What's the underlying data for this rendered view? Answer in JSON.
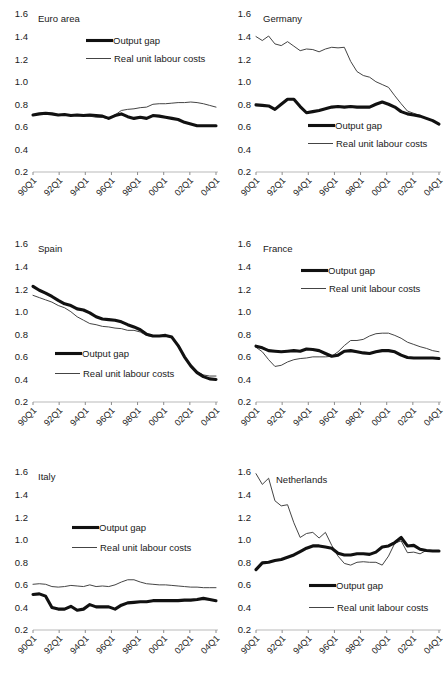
{
  "figure": {
    "panel_titles": [
      "Euro area",
      "Germany",
      "Spain",
      "France",
      "Italy",
      "Netherlands"
    ],
    "legend": {
      "output_gap": "Output gap",
      "rulc": "Real unit labour costs"
    },
    "axis": {
      "y_ticks": [
        "0.2",
        "0.4",
        "0.6",
        "0.8",
        "1.0",
        "1.2",
        "1.4",
        "1.6"
      ],
      "x_ticks": [
        "90Q1",
        "92Q1",
        "94Q1",
        "96Q1",
        "98Q1",
        "00Q1",
        "02Q1",
        "04Q1"
      ],
      "ylim": [
        0.2,
        1.6
      ],
      "grid": false
    },
    "colors": {
      "output_gap": "#111111",
      "rulc": "#444444",
      "axis": "#b9b9b9",
      "background": "#ffffff"
    }
  },
  "chart_data": [
    {
      "type": "line",
      "title": "Euro area",
      "xlabel": "",
      "ylabel": "",
      "ylim": [
        0.2,
        1.6
      ],
      "x": [
        "90Q1",
        "90Q3",
        "91Q1",
        "91Q3",
        "92Q1",
        "92Q3",
        "93Q1",
        "93Q3",
        "94Q1",
        "94Q3",
        "95Q1",
        "95Q3",
        "96Q1",
        "96Q3",
        "97Q1",
        "97Q3",
        "98Q1",
        "98Q3",
        "99Q1",
        "99Q3",
        "00Q1",
        "00Q3",
        "01Q1",
        "01Q3",
        "02Q1",
        "02Q3",
        "03Q1",
        "03Q3",
        "04Q1",
        "04Q3"
      ],
      "series": [
        {
          "name": "Output gap",
          "values": [
            0.705,
            0.715,
            0.72,
            0.715,
            0.705,
            0.71,
            0.7,
            0.705,
            0.7,
            0.705,
            0.7,
            0.695,
            0.675,
            0.7,
            0.715,
            0.69,
            0.675,
            0.685,
            0.675,
            0.7,
            0.695,
            0.685,
            0.675,
            0.665,
            0.64,
            0.625,
            0.61,
            0.61,
            0.61,
            0.61
          ]
        },
        {
          "name": "Real unit labour costs",
          "values": [
            0.705,
            0.715,
            0.715,
            0.71,
            0.705,
            0.71,
            0.7,
            0.7,
            0.695,
            0.695,
            0.685,
            0.685,
            0.67,
            0.705,
            0.745,
            0.755,
            0.76,
            0.77,
            0.775,
            0.8,
            0.805,
            0.805,
            0.81,
            0.815,
            0.815,
            0.82,
            0.815,
            0.805,
            0.79,
            0.775
          ]
        }
      ]
    },
    {
      "type": "line",
      "title": "Germany",
      "xlabel": "",
      "ylabel": "",
      "ylim": [
        0.2,
        1.6
      ],
      "x": [
        "90Q1",
        "90Q3",
        "91Q1",
        "91Q3",
        "92Q1",
        "92Q3",
        "93Q1",
        "93Q3",
        "94Q1",
        "94Q3",
        "95Q1",
        "95Q3",
        "96Q1",
        "96Q3",
        "97Q1",
        "97Q3",
        "98Q1",
        "98Q3",
        "99Q1",
        "99Q3",
        "00Q1",
        "00Q3",
        "01Q1",
        "01Q3",
        "02Q1",
        "02Q3",
        "03Q1",
        "03Q3",
        "04Q1",
        "04Q3"
      ],
      "series": [
        {
          "name": "Output gap",
          "values": [
            0.795,
            0.79,
            0.785,
            0.755,
            0.8,
            0.845,
            0.845,
            0.78,
            0.725,
            0.735,
            0.745,
            0.76,
            0.775,
            0.78,
            0.775,
            0.78,
            0.775,
            0.775,
            0.775,
            0.8,
            0.82,
            0.8,
            0.775,
            0.735,
            0.715,
            0.705,
            0.695,
            0.675,
            0.655,
            0.625
          ]
        },
        {
          "name": "Real unit labour costs",
          "values": [
            1.4,
            1.365,
            1.405,
            1.335,
            1.32,
            1.355,
            1.315,
            1.275,
            1.29,
            1.285,
            1.265,
            1.29,
            1.305,
            1.3,
            1.305,
            1.18,
            1.09,
            1.055,
            1.04,
            1.0,
            0.975,
            0.95,
            0.875,
            0.805,
            0.74,
            0.72,
            0.7,
            0.675,
            0.655,
            0.625
          ]
        }
      ]
    },
    {
      "type": "line",
      "title": "Spain",
      "xlabel": "",
      "ylabel": "",
      "ylim": [
        0.2,
        1.6
      ],
      "x": [
        "90Q1",
        "90Q3",
        "91Q1",
        "91Q3",
        "92Q1",
        "92Q3",
        "93Q1",
        "93Q3",
        "94Q1",
        "94Q3",
        "95Q1",
        "95Q3",
        "96Q1",
        "96Q3",
        "97Q1",
        "97Q3",
        "98Q1",
        "98Q3",
        "99Q1",
        "99Q3",
        "00Q1",
        "00Q3",
        "01Q1",
        "01Q3",
        "02Q1",
        "02Q3",
        "03Q1",
        "03Q3",
        "04Q1",
        "04Q3"
      ],
      "series": [
        {
          "name": "Output gap",
          "values": [
            1.225,
            1.19,
            1.165,
            1.135,
            1.1,
            1.07,
            1.055,
            1.025,
            1.015,
            0.99,
            0.955,
            0.935,
            0.93,
            0.925,
            0.91,
            0.885,
            0.865,
            0.84,
            0.8,
            0.785,
            0.785,
            0.79,
            0.775,
            0.7,
            0.6,
            0.52,
            0.46,
            0.425,
            0.405,
            0.4
          ]
        },
        {
          "name": "Real unit labour costs",
          "values": [
            1.145,
            1.125,
            1.105,
            1.085,
            1.055,
            1.035,
            1.0,
            0.955,
            0.925,
            0.895,
            0.885,
            0.87,
            0.865,
            0.855,
            0.85,
            0.835,
            0.835,
            0.82,
            0.79,
            0.78,
            0.785,
            0.79,
            0.775,
            0.705,
            0.605,
            0.525,
            0.47,
            0.44,
            0.43,
            0.43
          ]
        }
      ]
    },
    {
      "type": "line",
      "title": "France",
      "xlabel": "",
      "ylabel": "",
      "ylim": [
        0.2,
        1.6
      ],
      "x": [
        "90Q1",
        "90Q3",
        "91Q1",
        "91Q3",
        "92Q1",
        "92Q3",
        "93Q1",
        "93Q3",
        "94Q1",
        "94Q3",
        "95Q1",
        "95Q3",
        "96Q1",
        "96Q3",
        "97Q1",
        "97Q3",
        "98Q1",
        "98Q3",
        "99Q1",
        "99Q3",
        "00Q1",
        "00Q3",
        "01Q1",
        "01Q3",
        "02Q1",
        "02Q3",
        "03Q1",
        "03Q3",
        "04Q1",
        "04Q3"
      ],
      "series": [
        {
          "name": "Output gap",
          "values": [
            0.695,
            0.68,
            0.655,
            0.65,
            0.645,
            0.65,
            0.655,
            0.65,
            0.67,
            0.665,
            0.655,
            0.63,
            0.605,
            0.615,
            0.65,
            0.655,
            0.645,
            0.635,
            0.63,
            0.645,
            0.655,
            0.655,
            0.645,
            0.615,
            0.595,
            0.59,
            0.59,
            0.59,
            0.59,
            0.585
          ]
        },
        {
          "name": "Real unit labour costs",
          "values": [
            0.685,
            0.645,
            0.575,
            0.515,
            0.525,
            0.555,
            0.575,
            0.585,
            0.59,
            0.6,
            0.6,
            0.6,
            0.605,
            0.645,
            0.7,
            0.745,
            0.745,
            0.755,
            0.785,
            0.805,
            0.81,
            0.81,
            0.79,
            0.765,
            0.73,
            0.71,
            0.69,
            0.675,
            0.655,
            0.645
          ]
        }
      ]
    },
    {
      "type": "line",
      "title": "Italy",
      "xlabel": "",
      "ylabel": "",
      "ylim": [
        0.2,
        1.6
      ],
      "x": [
        "90Q1",
        "90Q3",
        "91Q1",
        "91Q3",
        "92Q1",
        "92Q3",
        "93Q1",
        "93Q3",
        "94Q1",
        "94Q3",
        "95Q1",
        "95Q3",
        "96Q1",
        "96Q3",
        "97Q1",
        "97Q3",
        "98Q1",
        "98Q3",
        "99Q1",
        "99Q3",
        "00Q1",
        "00Q3",
        "01Q1",
        "01Q3",
        "02Q1",
        "02Q3",
        "03Q1",
        "03Q3",
        "04Q1",
        "04Q3"
      ],
      "series": [
        {
          "name": "Output gap",
          "values": [
            0.515,
            0.52,
            0.5,
            0.4,
            0.385,
            0.385,
            0.41,
            0.375,
            0.385,
            0.425,
            0.405,
            0.405,
            0.405,
            0.385,
            0.42,
            0.44,
            0.445,
            0.45,
            0.45,
            0.46,
            0.46,
            0.46,
            0.46,
            0.46,
            0.465,
            0.465,
            0.47,
            0.48,
            0.47,
            0.46
          ]
        },
        {
          "name": "Real unit labour costs",
          "values": [
            0.605,
            0.61,
            0.605,
            0.585,
            0.58,
            0.585,
            0.595,
            0.59,
            0.585,
            0.6,
            0.585,
            0.59,
            0.585,
            0.6,
            0.625,
            0.645,
            0.645,
            0.625,
            0.61,
            0.605,
            0.6,
            0.6,
            0.595,
            0.59,
            0.585,
            0.58,
            0.58,
            0.575,
            0.575,
            0.575
          ]
        }
      ]
    },
    {
      "type": "line",
      "title": "Netherlands",
      "xlabel": "",
      "ylabel": "",
      "ylim": [
        0.2,
        1.6
      ],
      "x": [
        "90Q1",
        "90Q3",
        "91Q1",
        "91Q3",
        "92Q1",
        "92Q3",
        "93Q1",
        "93Q3",
        "94Q1",
        "94Q3",
        "95Q1",
        "95Q3",
        "96Q1",
        "96Q3",
        "97Q1",
        "97Q3",
        "98Q1",
        "98Q3",
        "99Q1",
        "99Q3",
        "00Q1",
        "00Q3",
        "01Q1",
        "01Q3",
        "02Q1",
        "02Q3",
        "03Q1",
        "03Q3",
        "04Q1",
        "04Q3"
      ],
      "series": [
        {
          "name": "Output gap",
          "values": [
            0.735,
            0.795,
            0.8,
            0.815,
            0.825,
            0.845,
            0.865,
            0.895,
            0.925,
            0.945,
            0.945,
            0.935,
            0.925,
            0.88,
            0.865,
            0.865,
            0.875,
            0.875,
            0.87,
            0.89,
            0.935,
            0.945,
            0.975,
            1.02,
            0.945,
            0.95,
            0.915,
            0.905,
            0.9,
            0.9
          ]
        },
        {
          "name": "Real unit labour costs",
          "values": [
            1.585,
            1.49,
            1.545,
            1.345,
            1.3,
            1.31,
            1.15,
            1.02,
            1.055,
            1.065,
            1.015,
            1.065,
            0.95,
            0.855,
            0.79,
            0.775,
            0.8,
            0.805,
            0.8,
            0.8,
            0.775,
            0.855,
            0.97,
            0.99,
            0.885,
            0.89,
            0.875,
            0.905,
            0.9,
            0.9
          ]
        }
      ]
    }
  ]
}
